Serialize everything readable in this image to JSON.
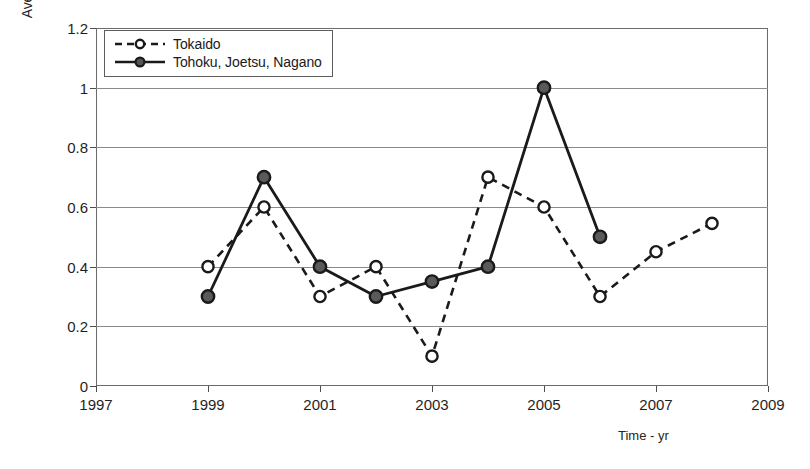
{
  "chart_data": {
    "type": "line",
    "title": "",
    "xlabel": "Time - yr",
    "ylabel": "Average delay per service/train - min",
    "xlim": [
      1997,
      2009
    ],
    "ylim": [
      0,
      1.2
    ],
    "xticks": [
      1997,
      1999,
      2001,
      2003,
      2005,
      2007,
      2009
    ],
    "xtick_labels": [
      "1997",
      "1999",
      "2001",
      "2003",
      "2005",
      "2007",
      "2009"
    ],
    "yticks": [
      0,
      0.2,
      0.4,
      0.6,
      0.8,
      1,
      1.2
    ],
    "ytick_labels": [
      "0",
      "0.2",
      "0.4",
      "0.6",
      "0.8",
      "1",
      "1.2"
    ],
    "grid": "horizontal",
    "legend_position": "top-left",
    "series": [
      {
        "name": "Tokaido",
        "marker": "open-circle",
        "line_style": "dashed",
        "color": "#1a1a1a",
        "x": [
          1999,
          2000,
          2001,
          2002,
          2003,
          2004,
          2005,
          2006,
          2007,
          2008
        ],
        "values": [
          0.4,
          0.6,
          0.3,
          0.4,
          0.1,
          0.7,
          0.6,
          0.3,
          0.45,
          0.545
        ]
      },
      {
        "name": "Tohoku, Joetsu, Nagano",
        "marker": "filled-circle",
        "line_style": "solid",
        "color": "#1a1a1a",
        "x": [
          1999,
          2000,
          2001,
          2002,
          2003,
          2004,
          2005,
          2006
        ],
        "values": [
          0.3,
          0.7,
          0.4,
          0.3,
          0.35,
          0.4,
          1.0,
          0.5
        ]
      }
    ]
  },
  "legend": {
    "items": [
      {
        "label": "Tokaido"
      },
      {
        "label": "Tohoku, Joetsu, Nagano"
      }
    ]
  },
  "axes": {
    "y_title": "Average delay per service/train - min",
    "x_title": "Time - yr"
  }
}
